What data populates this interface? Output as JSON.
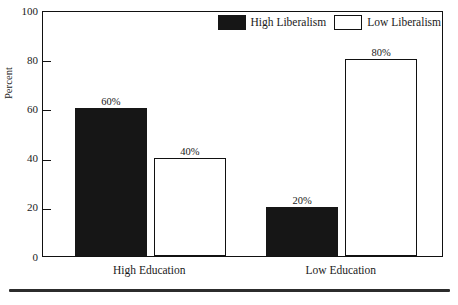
{
  "chart_data": {
    "type": "bar",
    "title": "",
    "subtitle": "",
    "xlabel": "",
    "ylabel": "Percent",
    "ylim": [
      0,
      100
    ],
    "ytick_labels": [
      "0",
      "20",
      "40",
      "60",
      "80",
      "100"
    ],
    "ytick_values": [
      0,
      20,
      40,
      60,
      80,
      100
    ],
    "grid": false,
    "legend_position": "top-right-inside",
    "categories": [
      "High Education",
      "Low Education"
    ],
    "series": [
      {
        "name": "High Liberalism",
        "swatch": "filled",
        "color": "#161616",
        "values": [
          60,
          20
        ],
        "data_labels": [
          "60%",
          "20%"
        ]
      },
      {
        "name": "Low Liberalism",
        "swatch": "hollow",
        "color": "#ffffff",
        "values": [
          40,
          80
        ],
        "data_labels": [
          "40%",
          "80%"
        ]
      }
    ]
  },
  "axes": {
    "y_title": "Percent"
  },
  "legend": {
    "entries": [
      {
        "label": "High Liberalism",
        "style": "filled"
      },
      {
        "label": "Low Liberalism",
        "style": "hollow"
      }
    ]
  },
  "colors": {
    "bar_filled": "#161616",
    "bar_hollow": "#ffffff",
    "frame": "#111111",
    "text": "#1a1a1a",
    "rule": "#2c2c2c",
    "background": "#ffffff"
  }
}
